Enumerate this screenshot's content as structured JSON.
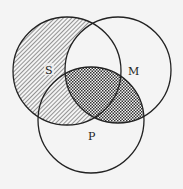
{
  "diagram": {
    "type": "venn",
    "sets": [
      {
        "id": "S",
        "label": "S"
      },
      {
        "id": "M",
        "label": "M"
      },
      {
        "id": "P",
        "label": "P"
      }
    ],
    "regions": [
      {
        "region": "S only",
        "shading": "diagonal-hatch"
      },
      {
        "region": "S and P, not M",
        "shading": "diagonal-hatch"
      },
      {
        "region": "S and M, not P",
        "shading": "none"
      },
      {
        "region": "M and P, not S",
        "shading": "crosshatch"
      },
      {
        "region": "S and M and P",
        "shading": "crosshatch"
      },
      {
        "region": "M only",
        "shading": "none"
      },
      {
        "region": "P only",
        "shading": "none"
      }
    ],
    "colors": {
      "background": "#f4f4f4",
      "stroke": "#222222"
    }
  }
}
